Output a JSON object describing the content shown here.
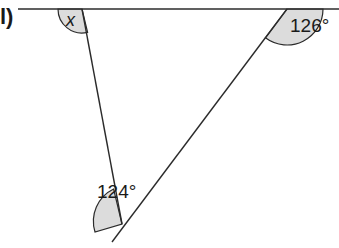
{
  "question_label": "l)",
  "diagram": {
    "colors": {
      "line": "#2b2b2b",
      "arc_fill": "#dcdcdc",
      "text": "#1a1a1a"
    },
    "angles": [
      {
        "label": "x",
        "position": "top-left intersection, left of transversal, below line"
      },
      {
        "label": "126°",
        "position": "top-right intersection, right of transversal, below line"
      },
      {
        "label": "124°",
        "position": "bottom vertex, left side"
      }
    ]
  }
}
